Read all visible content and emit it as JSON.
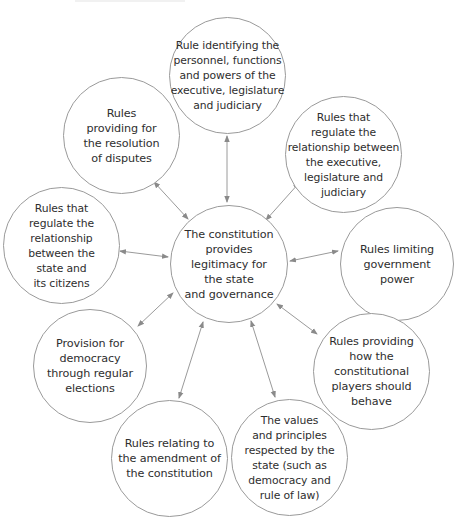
{
  "diagram": {
    "type": "hub-and-spoke",
    "colors": {
      "stroke": "#9a9a9a",
      "text": "#2e2e2e",
      "background": "#ffffff"
    },
    "center": {
      "label": "The constitution\nprovides\nlegitimacy for\nthe state\nand governance"
    },
    "nodes": [
      {
        "id": "top",
        "label": "Rule identifying the\npersonnel, functions\nand powers of the\nexecutive, legislature\nand judiciary"
      },
      {
        "id": "top-right",
        "label": "Rules that\nregulate the\nrelationship between\nthe executive,\nlegislature and\njudiciary"
      },
      {
        "id": "right",
        "label": "Rules limiting\ngovernment\npower"
      },
      {
        "id": "bottom-right",
        "label": "Rules providing\nhow the\nconstitutional\nplayers should\nbehave"
      },
      {
        "id": "bottom-center-right",
        "label": "The values\nand principles\nrespected by the\nstate (such as\ndemocracy and\nrule of law)"
      },
      {
        "id": "bottom-center-left",
        "label": "Rules relating to\nthe amendment of\nthe constitution"
      },
      {
        "id": "left-lower",
        "label": "Provision for\ndemocracy\nthrough regular\nelections"
      },
      {
        "id": "left",
        "label": "Rules that\nregulate the\nrelationship\nbetween the\nstate and\nits citizens"
      },
      {
        "id": "upper-left",
        "label": "Rules\nproviding for\nthe resolution\nof disputes"
      }
    ],
    "connections": "double-headed arrows between center and each outer node"
  }
}
